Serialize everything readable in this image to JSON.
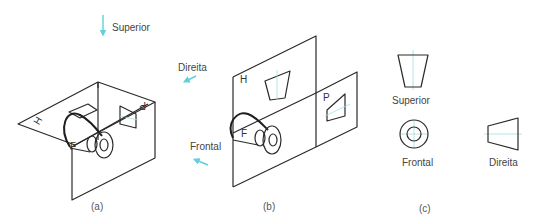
{
  "figure": {
    "panels": [
      {
        "id": "a",
        "caption": "(a)",
        "view_label": "Superior",
        "plane_labels": {
          "horizontal": "H",
          "frontal": "F",
          "profile": "P"
        }
      },
      {
        "id": "b",
        "caption": "(b)",
        "view_labels": {
          "right": "Direita",
          "front": "Frontal"
        },
        "plane_labels": {
          "horizontal": "H",
          "frontal": "F",
          "profile": "P"
        }
      },
      {
        "id": "c",
        "caption": "(c)",
        "views": {
          "top": "Superior",
          "front": "Frontal",
          "right": "Direita"
        }
      }
    ],
    "colors": {
      "line": "#2a2a2a",
      "arrow": "#5fd0dc",
      "centerline": "#9fe0e0",
      "text": "#444444"
    }
  }
}
